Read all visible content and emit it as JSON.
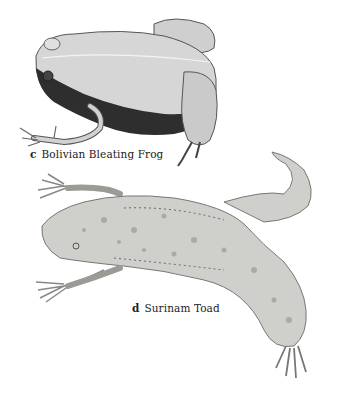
{
  "figures": [
    {
      "letter": "c",
      "caption": "Bolivian Bleating Frog",
      "illustration": "frog-illustration"
    },
    {
      "letter": "d",
      "caption": "Surinam Toad",
      "illustration": "toad-illustration"
    }
  ],
  "colors": {
    "background": "#ffffff",
    "text": "#222222",
    "frog_back": "#d4d4d4",
    "frog_flank": "#2e2e2e",
    "toad_body": "#cfcfcb",
    "toad_spots": "#8f8f8a"
  }
}
